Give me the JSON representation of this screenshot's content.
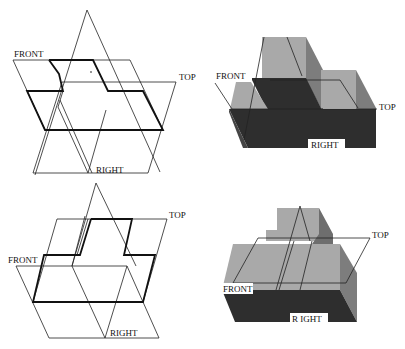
{
  "figure": {
    "panels": [
      {
        "id": "top-left",
        "type": "wireframe",
        "labels": {
          "front": "FRONT",
          "top": "TOP",
          "right": "RIGHT"
        }
      },
      {
        "id": "top-right",
        "type": "shaded-solid",
        "labels": {
          "front": "FRONT",
          "top": "TOP",
          "right": "RIGHT"
        }
      },
      {
        "id": "bottom-left",
        "type": "wireframe",
        "labels": {
          "front": "FRONT",
          "top": "TOP",
          "right": "RIGHT"
        }
      },
      {
        "id": "bottom-right",
        "type": "shaded-solid",
        "labels": {
          "front": "FRONT",
          "top": "TOP",
          "right": "R IGHT"
        }
      }
    ],
    "colors": {
      "light_face": "#a9a9a9",
      "mid_face": "#7d7d7d",
      "dark_face": "#2e2e2e",
      "line": "#222222",
      "background": "#ffffff"
    }
  }
}
